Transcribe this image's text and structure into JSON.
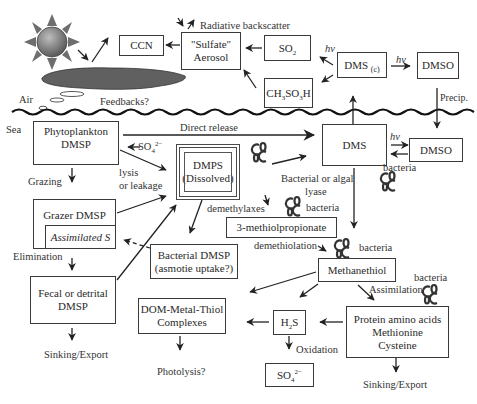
{
  "colors": {
    "line": "#222222",
    "cloud": "#555555",
    "sun": "#777777",
    "text": "#333333"
  },
  "atmosphere": {
    "radiative_backscatter": "Radiative backscatter",
    "ccn": "CCN",
    "sulfate_aerosol_line1": "\"Sulfate\"",
    "sulfate_aerosol_line2": "Aerosol",
    "so2": "SO",
    "so2_sub": "2",
    "ch3so3h": "CH3SO3H",
    "dms_c": "DMS",
    "dms_c_sub": "(c)",
    "dmso": "DMSO",
    "hv1": "hv",
    "hv2": "hv",
    "precip": "Precip.",
    "air": "Air",
    "feedbacks": "Feedbacks?"
  },
  "ocean": {
    "sea": "Sea",
    "phytoplankton_line1": "Phytoplankton",
    "phytoplankton_line2": "DMSP",
    "so4_in": "SO",
    "so4_sub": "4",
    "so4_sup": "2−",
    "direct_release": "Direct release",
    "grazing": "Grazing",
    "lysis_line1": "lysis",
    "lysis_line2": "or leakage",
    "dmsp_dissolved_line1": "DMPS",
    "dmsp_dissolved_line2": "(Dissolved)",
    "dms": "DMS",
    "hv3": "hv",
    "dmso": "DMSO",
    "bacteria_dmso": "bacteria",
    "lyase_line1": "Bacterial or algal",
    "lyase_line2": "lyase",
    "grazer_dmsp": "Grazer DMSP",
    "assimilated_s": "Assimilated S",
    "demethylaxes": "demethylaxes",
    "bacteria_demethyl": "bacteria",
    "methiolpropionate": "3-methiolpropionate",
    "demethiolation": "demethiolation",
    "bacteria_demethiol": "bacteria",
    "bacterial_dmsp_line1": "Bacterial DMSP",
    "bacterial_dmsp_line2": "(asmotie uptake?)",
    "elimination": "Elimination",
    "methanethiol": "Methanethiol",
    "bacteria_assim": "bacteria",
    "assimilation": "Assimilation",
    "fecal_line1": "Fecal or detrital",
    "fecal_line2": "DMSP",
    "dom_line1": "DOM-Metal-Thiol",
    "dom_line2": "Complexes",
    "h2s": "H",
    "h2s_sub": "2",
    "h2s_end": "S",
    "protein_line1": "Protein amino acids",
    "protein_line2": "Methionine",
    "protein_line3": "Cysteine",
    "oxidation": "Oxidation",
    "so4_out": "SO",
    "so4_out_sub": "4",
    "so4_out_sup": "2−",
    "sinking_export_left": "Sinking/Export",
    "photolysis": "Photolysis?",
    "sinking_export_right": "Sinking/Export"
  }
}
